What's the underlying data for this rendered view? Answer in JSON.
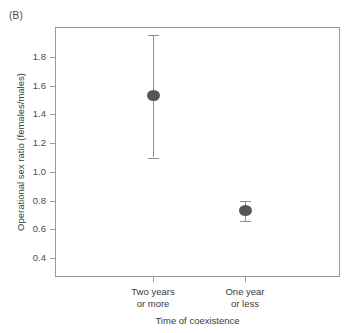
{
  "panel": {
    "label": "(B)"
  },
  "chart_data": {
    "type": "scatter",
    "title": "",
    "xlabel": "Time of coexistence",
    "ylabel": "Operational sex ratio (females/males)",
    "categories": [
      "Two years or more",
      "One year or less"
    ],
    "category_lines": [
      {
        "line1": "Two years",
        "line2": "or more"
      },
      {
        "line1": "One year",
        "line2": "or less"
      }
    ],
    "values": [
      1.53,
      0.73
    ],
    "error_low": [
      1.1,
      0.66
    ],
    "error_high": [
      1.95,
      0.8
    ],
    "ylim": [
      0.3,
      1.99
    ],
    "yticks": [
      1.8,
      1.6,
      1.4,
      1.2,
      1.0,
      0.8,
      0.6,
      0.4
    ],
    "ytick_labels": [
      "1.8",
      "1.6",
      "1.4",
      "1.2",
      "1.0",
      "0.8",
      "0.6",
      "0.4"
    ],
    "grid": false,
    "legend": null,
    "marker_color": "#565656",
    "errorbar_color": "#8e8e8e",
    "frame_color": "#9a9a9a"
  }
}
